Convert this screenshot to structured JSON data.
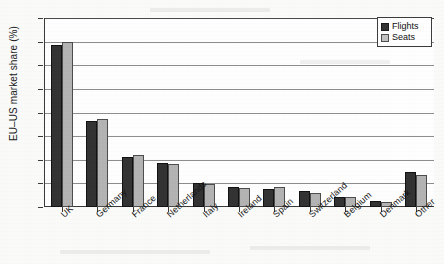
{
  "chart_data": {
    "type": "bar",
    "title": "",
    "xlabel": "",
    "ylabel": "EU–US market share (%)",
    "ylim": [
      0,
      40
    ],
    "yticks": [
      0,
      5,
      10,
      15,
      20,
      25,
      30,
      35,
      40
    ],
    "grid": true,
    "legend_position": "top-right",
    "categories": [
      "UK",
      "Germany",
      "France",
      "Netherlands",
      "Italy",
      "Ireland",
      "Spain",
      "Switzerland",
      "Belgium",
      "Denmark",
      "Other"
    ],
    "series": [
      {
        "name": "Flights",
        "color": "#333333",
        "values": [
          34.3,
          18.1,
          10.6,
          9.3,
          5.0,
          4.2,
          3.9,
          3.3,
          2.2,
          1.2,
          7.4
        ]
      },
      {
        "name": "Seats",
        "color": "#b4b4b4",
        "values": [
          34.9,
          18.7,
          11.0,
          9.2,
          4.9,
          4.1,
          4.2,
          3.0,
          2.1,
          1.1,
          6.7
        ]
      }
    ]
  },
  "legend": {
    "entries": [
      {
        "label": "Flights"
      },
      {
        "label": "Seats"
      }
    ]
  },
  "axis": {
    "y_tick_labels": [
      "40",
      "35",
      "30",
      "25",
      "20",
      "15",
      "10",
      "5",
      "0"
    ],
    "y_axis_title": "EU–US market share (%)"
  }
}
